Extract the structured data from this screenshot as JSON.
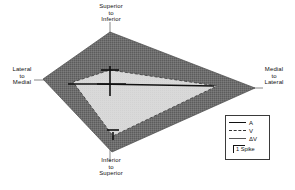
{
  "figure": {
    "type": "polar-tuning-plot",
    "background": "#ffffff"
  },
  "axes": {
    "top": {
      "line1": "Superior",
      "line2": "to",
      "line3": "Inferior"
    },
    "bottom": {
      "line1": "Inferior",
      "line2": "to",
      "line3": "Superior"
    },
    "left": {
      "line1": "Lateral",
      "line2": "to",
      "line3": "Medial"
    },
    "right": {
      "line1": "Medial",
      "line2": "to",
      "line3": "Lateral"
    }
  },
  "legend": {
    "entries": [
      {
        "label": "A",
        "style": "solid"
      },
      {
        "label": "V",
        "style": "dashed"
      },
      {
        "label": "ΔV",
        "style": "thin"
      }
    ],
    "scale": {
      "label": "1 Spike"
    }
  },
  "colors": {
    "outer_fill": "#6e6e6e",
    "inner_fill": "#d9d9d9",
    "outline": "#3a3a3a",
    "marker": "#111111",
    "axis_line": "#6a6a6a"
  },
  "chart_data": {
    "type": "radar",
    "title": "",
    "xlabel": "",
    "ylabel": "",
    "grid": false,
    "legend_position": "bottom-right",
    "axis_order": [
      "Superior to Inferior",
      "Medial to Lateral",
      "Inferior to Superior",
      "Lateral to Medial"
    ],
    "axis_angles_deg": [
      90,
      0,
      270,
      180
    ],
    "center": {
      "x": 110,
      "y": 92
    },
    "unit": "spikes",
    "scale_bar_spikes": 1,
    "series": [
      {
        "name": "ΔV",
        "style": "filled-dark",
        "fill": "#6e6e6e",
        "values": [
          60,
          145,
          60,
          67
        ],
        "vertices_px": [
          [
            110,
            32
          ],
          [
            255,
            88
          ],
          [
            112,
            152
          ],
          [
            43,
            79
          ]
        ]
      },
      {
        "name": "V",
        "style": "dashed-light",
        "fill": "#d9d9d9",
        "values": [
          22,
          107,
          44,
          37
        ],
        "vertices_px": [
          [
            110,
            70
          ],
          [
            217,
            86
          ],
          [
            113,
            136
          ],
          [
            73,
            82
          ]
        ]
      },
      {
        "name": "A",
        "style": "solid-bars",
        "fill": "none",
        "values": [
          26,
          104,
          46,
          42
        ],
        "vertices_px": [
          [
            110,
            66
          ],
          [
            214,
            86
          ],
          [
            113,
            138
          ],
          [
            68,
            84
          ]
        ]
      }
    ]
  }
}
